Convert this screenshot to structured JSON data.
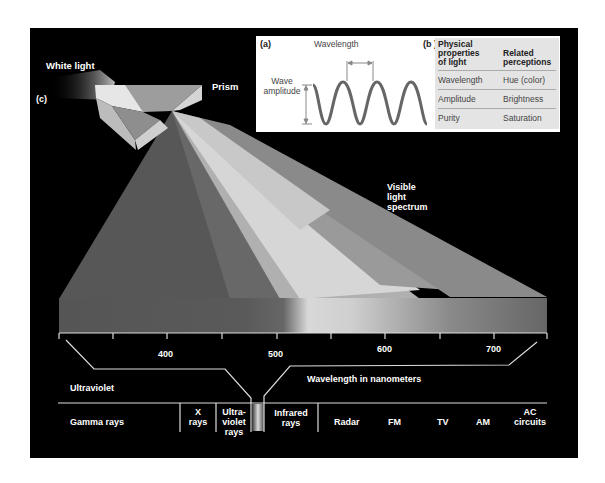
{
  "labels": {
    "white_light": "White light",
    "prism": "Prism",
    "panel_c": "(c)",
    "visible_spectrum": "Visible\nlight\nspectrum",
    "visible_1": "Visible",
    "visible_2": "light",
    "visible_3": "spectrum",
    "ultraviolet": "Ultraviolet",
    "wavelength_nm": "Wavelength in nanometers"
  },
  "panel_a": {
    "tag": "(a)",
    "wavelength": "Wavelength",
    "amplitude_1": "Wave",
    "amplitude_2": "amplitude"
  },
  "panel_b": {
    "tag": "(b )",
    "header_left_1": "Physical",
    "header_left_2": "properties",
    "header_left_3": "of light",
    "header_right_1": "Related",
    "header_right_2": "perceptions",
    "rows": [
      {
        "property": "Wavelength",
        "perception": "Hue (color)"
      },
      {
        "property": "Amplitude",
        "perception": "Brightness"
      },
      {
        "property": "Purity",
        "perception": "Saturation"
      }
    ]
  },
  "axis": {
    "ticks": [
      "400",
      "500",
      "600",
      "700"
    ]
  },
  "em_spectrum": {
    "bands": [
      {
        "l1": "Gamma rays"
      },
      {
        "l1": "X",
        "l2": "rays"
      },
      {
        "l1": "Ultra-",
        "l2": "violet",
        "l3": "rays"
      },
      {
        "l1": "Infrared",
        "l2": "rays"
      },
      {
        "l1": "Radar"
      },
      {
        "l1": "FM"
      },
      {
        "l1": "TV"
      },
      {
        "l1": "AM"
      },
      {
        "l1": "AC",
        "l2": "circuits"
      }
    ]
  },
  "colors": {
    "frame": "#000000",
    "spectrum_gray": "#5a5a5a",
    "table_bg": "#e4e4e4",
    "wave": "#666666"
  }
}
